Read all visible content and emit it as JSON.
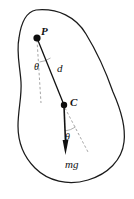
{
  "figure": {
    "canvas": {
      "width": 134,
      "height": 199
    },
    "colors": {
      "outline": "#1a1a1a",
      "line": "#111111",
      "dashed": "#9a9a9a",
      "node": "#0d0d0d",
      "background": "#ffffff"
    },
    "labels": {
      "pivot_point": "P",
      "center_of_mass": "C",
      "distance": "d",
      "angle_at_pivot": "θ",
      "angle_at_com": "θ",
      "weight_force": "mg"
    },
    "points": {
      "P": {
        "x": 37,
        "y": 38
      },
      "C": {
        "x": 64,
        "y": 105
      }
    },
    "elements": [
      {
        "name": "body-outline",
        "kind": "closed-curve"
      },
      {
        "name": "pivot-node",
        "kind": "dot"
      },
      {
        "name": "com-node",
        "kind": "dot"
      },
      {
        "name": "rod-segment",
        "kind": "line"
      },
      {
        "name": "vertical-reference-at-pivot",
        "kind": "dashed-line"
      },
      {
        "name": "vertical-reference-at-com",
        "kind": "dashed-line"
      },
      {
        "name": "weight-vector",
        "kind": "arrow"
      },
      {
        "name": "angle-arc-pivot",
        "kind": "arc"
      },
      {
        "name": "angle-arc-com",
        "kind": "arc"
      }
    ]
  }
}
